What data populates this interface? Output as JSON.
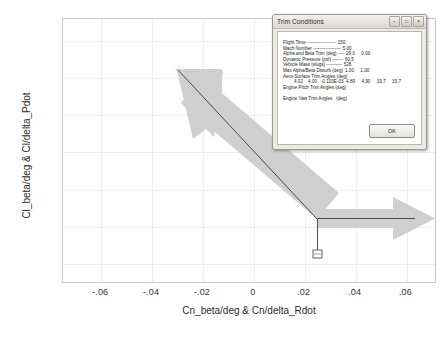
{
  "chart_data": {
    "type": "scatter",
    "title": "",
    "xlabel": "Cn_beta/deg & Cn/delta_Rdot",
    "ylabel": "Cl_beta/deg & Cl/delta_Pdot",
    "xlim": [
      -0.075,
      0.072
    ],
    "ylim": [
      -0.031,
      0.112
    ],
    "xticks": [
      "-.06",
      "-.04",
      "-.02",
      "0",
      ".02",
      ".04",
      ".06"
    ],
    "xtick_values": [
      -0.06,
      -0.04,
      -0.02,
      0,
      0.02,
      0.04,
      0.06
    ],
    "yticks": [
      ".10",
      ".08",
      ".06",
      ".04",
      ".02",
      "0",
      "-.02"
    ],
    "ytick_values": [
      0.1,
      0.08,
      0.06,
      0.04,
      0.02,
      0,
      -0.02
    ],
    "grid": true,
    "legend": "none",
    "vectors": [
      {
        "name": "aero-stability-vector",
        "x0": 0,
        "y0": 0,
        "x1": -0.0505,
        "y1": 0.0905,
        "style": "thick-gray-arrow"
      },
      {
        "name": "control-vector",
        "x0": 0,
        "y0": 0,
        "x1": 0.0505,
        "y1": 0.0,
        "style": "thick-gray-arrow"
      }
    ],
    "lines": [
      {
        "name": "origin-drop-line",
        "x0": 0,
        "y0": 0,
        "x1": 0,
        "y1": -0.018,
        "style": "thin-dark"
      }
    ],
    "markers": [
      {
        "name": "square-marker",
        "x": 0,
        "y": -0.018,
        "style": "small-square"
      }
    ]
  },
  "dialog": {
    "title": "Trim Conditions",
    "window_buttons": [
      {
        "name": "minimize-button",
        "glyph": "–"
      },
      {
        "name": "maximize-button",
        "glyph": "□"
      },
      {
        "name": "close-button",
        "glyph": "×"
      }
    ],
    "rows": [
      {
        "label": "Flight Time -------------------",
        "values": "150."
      },
      {
        "label": "Mach Number ------------------",
        "values": "5.00"
      },
      {
        "label": "Alpha and Beta Trim (deg) ----",
        "values": "29.0     0.00"
      },
      {
        "label": "Dynamic Pressure (psf) -------",
        "values": "60.5"
      },
      {
        "label": "Vehicle Mass (slugs) ----------",
        "values": "528"
      },
      {
        "label": "Max Alpha/Beta Disturb (deg)",
        "values": "1.00     1.00"
      },
      {
        "label": "Aero-Surface Trim Angles (deg)",
        "values": ""
      },
      {
        "label": "",
        "values": "4.02    4.00   -0.103E-03  4.89     4.90     33.7     33.7",
        "indent": true
      },
      {
        "label": "Engine Pitch Trim Angles (deg)",
        "values": ""
      },
      {
        "label": "",
        "values": "",
        "spacer": true
      },
      {
        "label": "Engine Yaw Trim Angles   (deg)",
        "values": ""
      }
    ],
    "ok_label": "OK"
  },
  "colors": {
    "plot_background": "#ffffff",
    "grid": "#ededed",
    "frame": "#c9c9c9",
    "arrow_fill": "#cfcfcf",
    "arrow_line": "#4a4a4a",
    "dialog_face": "#eceae4"
  }
}
